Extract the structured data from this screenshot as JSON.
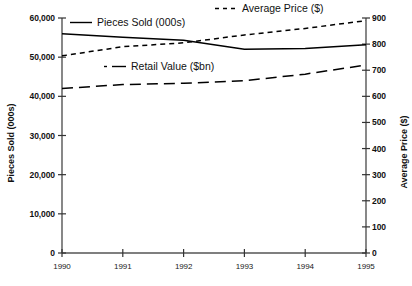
{
  "chart_data": {
    "type": "line",
    "title": "",
    "xlabel": "",
    "ylabel": "Pieces Sold (000s)",
    "ylabel_right": "Average Price ($)",
    "x": [
      1990,
      1991,
      1992,
      1993,
      1994,
      1995
    ],
    "xtick_labels": [
      "1990",
      "1991",
      "1992",
      "1993",
      "1994",
      "1995"
    ],
    "xlim": [
      1990,
      1995
    ],
    "ylim": [
      0,
      60000
    ],
    "ylim_right": [
      0,
      900
    ],
    "ytick_labels_left": [
      "60,000",
      "50,000",
      "40,000",
      "30,000",
      "20,000",
      "10,000",
      "0"
    ],
    "ytick_values_left": [
      60000,
      50000,
      40000,
      30000,
      20000,
      10000,
      0
    ],
    "ytick_labels_right": [
      "900",
      "800",
      "700",
      "600",
      "500",
      "400",
      "300",
      "200",
      "100",
      "0"
    ],
    "ytick_values_right": [
      900,
      800,
      700,
      600,
      500,
      400,
      300,
      200,
      100,
      0
    ],
    "grid": false,
    "legend_position": "in-plot",
    "series": [
      {
        "name": "Pieces Sold (000s)",
        "axis": "left",
        "style": "solid",
        "color": "#000000",
        "values": [
          56000,
          55100,
          54300,
          52000,
          52200,
          53200
        ]
      },
      {
        "name": "Average Price ($)",
        "axis": "right",
        "style": "dotted",
        "color": "#000000",
        "values": [
          755,
          790,
          805,
          835,
          860,
          890
        ]
      },
      {
        "name": "Retail Value ($bn)",
        "axis": "right",
        "style": "dashed",
        "color": "#000000",
        "values": [
          630,
          645,
          650,
          660,
          685,
          720
        ]
      }
    ]
  },
  "legend": {
    "pieces_sold": "Pieces Sold (000s)",
    "average_price": "Average Price ($)",
    "retail_value": "Retail Value ($bn)"
  },
  "axes": {
    "left_title": "Pieces Sold (000s)",
    "right_title": "Average Price ($)"
  }
}
